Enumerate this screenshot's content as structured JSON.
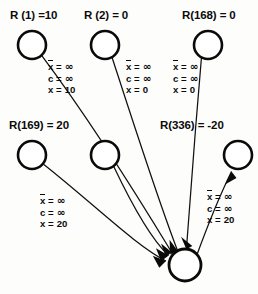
{
  "diagram": {
    "type": "network-flow-graph",
    "colors": {
      "stroke": "#0a0a0a",
      "node_fill": "#ffffff",
      "background": "#fdfdfc",
      "text": "#0b0b0b"
    },
    "nodes": [
      {
        "id": "n1",
        "label_prefix": "R",
        "arg": "1",
        "value": "10",
        "label": "R (1) =10",
        "cx": 32,
        "cy": 45,
        "r": 14,
        "labeled": true,
        "label_x": 10,
        "label_y": 10
      },
      {
        "id": "n2",
        "label_prefix": "R",
        "arg": "2",
        "value": "0",
        "label": "R (2) = 0",
        "cx": 105,
        "cy": 45,
        "r": 14,
        "labeled": true,
        "label_x": 83,
        "label_y": 10
      },
      {
        "id": "n168",
        "label_prefix": "R",
        "arg": "168",
        "value": "0",
        "label": "R(168) = 0",
        "cx": 208,
        "cy": 45,
        "r": 14,
        "labeled": true,
        "label_x": 182,
        "label_y": 10
      },
      {
        "id": "n169",
        "label_prefix": "R",
        "arg": "169",
        "value": "20",
        "label": "R(169) = 20",
        "cx": 32,
        "cy": 155,
        "r": 14,
        "labeled": true,
        "label_x": 8,
        "label_y": 120
      },
      {
        "id": "nmid",
        "label_prefix": "",
        "arg": "",
        "value": "",
        "label": "",
        "cx": 105,
        "cy": 155,
        "r": 14,
        "labeled": false,
        "label_x": 0,
        "label_y": 0
      },
      {
        "id": "n336",
        "label_prefix": "R",
        "arg": "336",
        "value": "-20",
        "label": "R(336) = -20",
        "cx": 238,
        "cy": 155,
        "r": 14,
        "labeled": true,
        "label_x": 160,
        "label_y": 120
      }
    ],
    "sink": {
      "id": "sink",
      "cx": 185,
      "cy": 265,
      "r": 16,
      "label": ""
    },
    "edge_labels": [
      {
        "id": "edge-label-1",
        "for_edge": "n1-to-sink",
        "x": 48,
        "y": 62,
        "xbar_line": "x̄ = ∞",
        "c_line": "c = ∞",
        "x_line": "x = 10",
        "xbar_symbol": "x",
        "xbar_value": "∞",
        "c_symbol": "c",
        "c_value": "∞",
        "x_symbol": "x",
        "x_value": "10"
      },
      {
        "id": "edge-label-2",
        "for_edge": "n2-to-sink",
        "x": 126,
        "y": 62,
        "xbar_line": "x̄ = ∞",
        "c_line": "c = ∞",
        "x_line": "x = 0",
        "xbar_symbol": "x",
        "xbar_value": "∞",
        "c_symbol": "c",
        "c_value": "∞",
        "x_symbol": "x",
        "x_value": "0"
      },
      {
        "id": "edge-label-3",
        "for_edge": "n168-to-sink",
        "x": 173,
        "y": 62,
        "xbar_line": "x̄ = ∞",
        "c_line": "c = ∞",
        "x_line": "x = 0",
        "xbar_symbol": "x",
        "xbar_value": "∞",
        "c_symbol": "c",
        "c_value": "∞",
        "x_symbol": "x",
        "x_value": "0"
      },
      {
        "id": "edge-label-4",
        "for_edge": "n169-to-sink",
        "x": 40,
        "y": 196,
        "xbar_line": "x̄ = ∞",
        "c_line": "c = ∞",
        "x_line": "x = 20",
        "xbar_symbol": "x",
        "xbar_value": "∞",
        "c_symbol": "c",
        "c_value": "∞",
        "x_symbol": "x",
        "x_value": "20"
      },
      {
        "id": "edge-label-5",
        "for_edge": "sink-to-n336",
        "x": 207,
        "y": 192,
        "xbar_line": "x̄ = ∞",
        "c_line": "c = ∞",
        "x_line": "x = 20",
        "xbar_symbol": "x",
        "xbar_value": "∞",
        "c_symbol": "c",
        "c_value": "∞",
        "x_symbol": "x",
        "x_value": "20"
      }
    ],
    "edges": [
      {
        "id": "e1",
        "from": "n1",
        "to": "sink",
        "direction": "into-sink",
        "arrow": true
      },
      {
        "id": "e2",
        "from": "n2",
        "to": "sink",
        "direction": "into-sink",
        "arrow": true
      },
      {
        "id": "e3",
        "from": "n168",
        "to": "sink",
        "direction": "into-sink",
        "arrow": true
      },
      {
        "id": "e4",
        "from": "n169",
        "to": "sink",
        "direction": "into-sink",
        "arrow": true
      },
      {
        "id": "e5",
        "from": "nmid",
        "to": "sink",
        "direction": "into-sink",
        "arrow": true
      },
      {
        "id": "e6",
        "from": "sink",
        "to": "n336",
        "direction": "out-of-sink",
        "arrow": true
      }
    ],
    "symbols": {
      "infinity": "∞",
      "equals": "=",
      "minus": "-"
    }
  }
}
